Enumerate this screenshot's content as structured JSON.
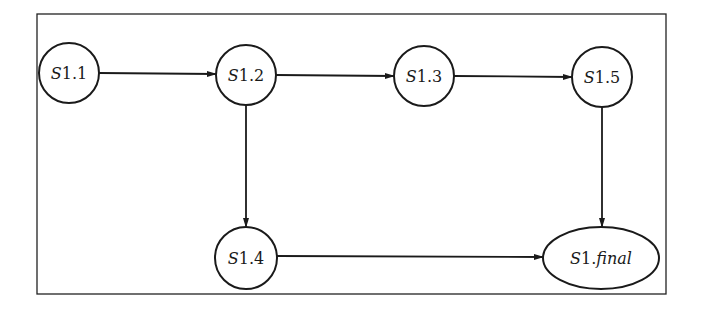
{
  "diagram": {
    "type": "state-flow",
    "frame": {
      "x": 37,
      "y": 14,
      "width": 629,
      "height": 280
    },
    "nodes": [
      {
        "id": "S1.1",
        "prefix": "S",
        "suffix": "1.1",
        "shape": "circle",
        "cx": 69,
        "cy": 73,
        "r": 30
      },
      {
        "id": "S1.2",
        "prefix": "S",
        "suffix": "1.2",
        "shape": "circle",
        "cx": 246,
        "cy": 75,
        "r": 30
      },
      {
        "id": "S1.3",
        "prefix": "S",
        "suffix": "1.3",
        "shape": "circle",
        "cx": 424,
        "cy": 76,
        "r": 30
      },
      {
        "id": "S1.5",
        "prefix": "S",
        "suffix": "1.5",
        "shape": "circle",
        "cx": 602,
        "cy": 77,
        "r": 30
      },
      {
        "id": "S1.4",
        "prefix": "S",
        "suffix": "1.4",
        "shape": "circle",
        "cx": 246,
        "cy": 258,
        "r": 31
      },
      {
        "id": "S1.final",
        "prefix": "S",
        "suffix": "1.",
        "suffix_italic": "final",
        "shape": "ellipse",
        "cx": 601,
        "cy": 258,
        "rx": 58,
        "ry": 31
      }
    ],
    "edges": [
      {
        "from": "S1.1",
        "to": "S1.2"
      },
      {
        "from": "S1.2",
        "to": "S1.3"
      },
      {
        "from": "S1.3",
        "to": "S1.5"
      },
      {
        "from": "S1.2",
        "to": "S1.4"
      },
      {
        "from": "S1.5",
        "to": "S1.final"
      },
      {
        "from": "S1.4",
        "to": "S1.final"
      }
    ],
    "labels": {
      "n1": {
        "pre": "S",
        "post": "1.1"
      },
      "n2": {
        "pre": "S",
        "post": "1.2"
      },
      "n3": {
        "pre": "S",
        "post": "1.3"
      },
      "n5": {
        "pre": "S",
        "post": "1.5"
      },
      "n4": {
        "pre": "S",
        "post": "1.4"
      },
      "nf": {
        "pre": "S",
        "post": "1.",
        "italic": "final"
      }
    },
    "colors": {
      "stroke": "#1a1a1a",
      "background": "#ffffff"
    }
  }
}
